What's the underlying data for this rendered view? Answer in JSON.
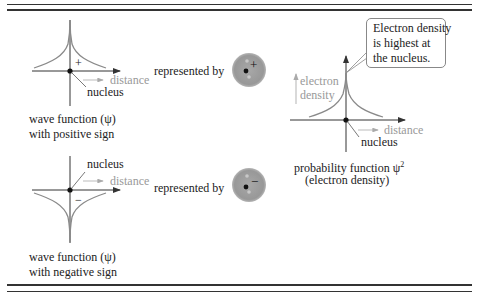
{
  "top_graph": {
    "sign": "+",
    "axis_label": "distance",
    "pointer_label": "nucleus",
    "caption_line1": "wave function (ψ)",
    "caption_line2": "with positive sign",
    "represented_by": "represented by",
    "orbital_sign": "+"
  },
  "bottom_graph": {
    "sign": "−",
    "axis_label": "distance",
    "pointer_label": "nucleus",
    "caption_line1": "wave function (ψ)",
    "caption_line2": "with negative sign",
    "represented_by": "represented by",
    "orbital_sign": "−"
  },
  "right_graph": {
    "y_label_line1": "electron",
    "y_label_line2": "density",
    "axis_label": "distance",
    "pointer_label": "nucleus",
    "caption_line1": "probability function ψ",
    "caption_superscript": "2",
    "caption_line2": "(electron density)",
    "callout_line1": "Electron density",
    "callout_line2": "is highest at",
    "callout_line3": "the nucleus."
  },
  "colors": {
    "rule": "#333333",
    "curve": "#8a8a8a",
    "axis": "#333333",
    "label_gray": "#999999",
    "orbital_fill": "#9a9a9a"
  }
}
